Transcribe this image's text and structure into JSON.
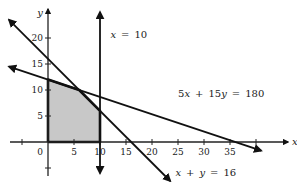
{
  "chart_data": {
    "type": "line",
    "title": "",
    "xlabel": "x",
    "ylabel": "y",
    "xlim": [
      -7.5,
      46
    ],
    "ylim": [
      -6.5,
      25.5
    ],
    "grid": false,
    "x_ticks": [
      -5,
      5,
      10,
      15,
      20,
      25,
      30,
      35,
      40
    ],
    "x_tick_labels": [
      "",
      "5",
      "10",
      "15",
      "20",
      "25",
      "30",
      "35",
      ""
    ],
    "y_ticks": [
      -5,
      5,
      10,
      15,
      20
    ],
    "y_tick_labels": [
      "",
      "5",
      "10",
      "15",
      "20"
    ],
    "origin_label": "0",
    "series": [
      {
        "name": "x = 10",
        "kind": "vertical",
        "x": 10,
        "y_range": [
          -6,
          25
        ],
        "label_pos": [
          12,
          20
        ]
      },
      {
        "name": "x + y = 16",
        "kind": "line",
        "points": [
          [
            -7.5,
            23.5
          ],
          [
            23.5,
            -7.5
          ]
        ],
        "label_pos": [
          24.5,
          -6.5
        ]
      },
      {
        "name": "5x + 15y = 180",
        "kind": "line",
        "points": [
          [
            -7.5,
            14.5
          ],
          [
            41,
            -1.67
          ]
        ],
        "label_pos": [
          25,
          8.6
        ]
      }
    ],
    "feasible_region": {
      "vertices": [
        [
          0,
          0
        ],
        [
          0,
          12
        ],
        [
          6,
          10
        ],
        [
          10,
          6
        ],
        [
          10,
          0
        ]
      ],
      "fill": "#c8c8c8"
    },
    "colors": {
      "line": "#111111",
      "axis": "#222222",
      "background": "#ffffff"
    }
  }
}
